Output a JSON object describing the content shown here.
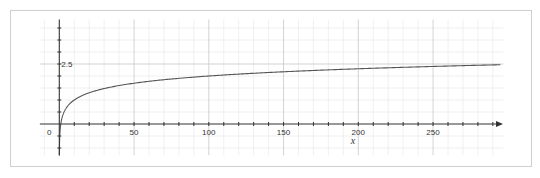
{
  "chart_data": {
    "type": "line",
    "title": "",
    "xlabel": "x",
    "ylabel": "",
    "function": "log10(x)",
    "xlim": [
      -13,
      297
    ],
    "ylim": [
      -1.3,
      4.35
    ],
    "grid": true,
    "x_tick_labels": [
      "0",
      "50",
      "100",
      "150",
      "200",
      "250"
    ],
    "x_tick_values": [
      0,
      50,
      100,
      150,
      200,
      250
    ],
    "y_tick_labels": [
      "2.5"
    ],
    "y_tick_values": [
      2.5
    ],
    "minor_x_step": 10,
    "minor_y_step": 0.5,
    "series": [
      {
        "name": "f(x)",
        "x": [
          1,
          2,
          5,
          10,
          20,
          50,
          100,
          150,
          200,
          250,
          296
        ],
        "values": [
          0,
          0.3,
          0.7,
          1.0,
          1.3,
          1.7,
          2.0,
          2.18,
          2.3,
          2.4,
          2.47
        ]
      }
    ],
    "legend": "none"
  },
  "colors": {
    "curve": "#555555",
    "axis": "#333333",
    "grid_minor": "#ececec",
    "grid_major": "#c8c8c8",
    "frame": "#cfcfcf"
  }
}
